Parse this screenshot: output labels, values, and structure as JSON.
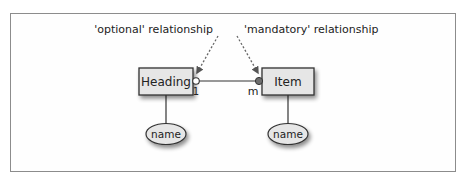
{
  "diagram": {
    "annotations": {
      "optional": "'optional' relationship",
      "mandatory": "'mandatory' relationship"
    },
    "entities": [
      {
        "id": "heading",
        "label": "Heading"
      },
      {
        "id": "item",
        "label": "Item"
      }
    ],
    "attributes": [
      {
        "entity": "heading",
        "label": "name"
      },
      {
        "entity": "item",
        "label": "name"
      }
    ],
    "relationship": {
      "from": "Heading",
      "to": "Item",
      "cardinality_from": "1",
      "cardinality_to": "m",
      "from_participation": "optional",
      "to_participation": "mandatory"
    },
    "colors": {
      "entity_fill": "#e6e6e6",
      "entity_border": "#333333",
      "mandatory_dot": "#6e6e6e",
      "optional_dot": "#ffffff",
      "frame_border": "#8c8c8c"
    }
  }
}
